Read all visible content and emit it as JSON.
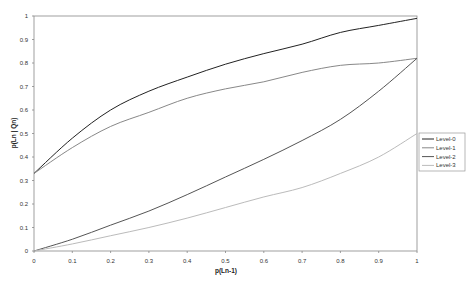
{
  "chart_data": {
    "type": "line",
    "title": "",
    "xlabel": "p(Ln-1)",
    "ylabel": "p(Ln | Qn)",
    "xlim": [
      0,
      1
    ],
    "ylim": [
      0,
      1
    ],
    "grid": false,
    "legend_position": "right",
    "x_ticks": [
      "0",
      "0.1",
      "0.2",
      "0.3",
      "0.4",
      "0.5",
      "0.6",
      "0.7",
      "0.8",
      "0.9",
      "1"
    ],
    "y_ticks": [
      "0",
      "0.1",
      "0.2",
      "0.3",
      "0.4",
      "0.5",
      "0.6",
      "0.7",
      "0.8",
      "0.9",
      "1"
    ],
    "x": [
      0,
      0.1,
      0.2,
      0.3,
      0.4,
      0.5,
      0.6,
      0.7,
      0.8,
      0.9,
      1.0
    ],
    "series": [
      {
        "name": "Level-0",
        "color": "#222222",
        "values": [
          0.33,
          0.48,
          0.6,
          0.68,
          0.74,
          0.795,
          0.84,
          0.88,
          0.93,
          0.96,
          0.99
        ]
      },
      {
        "name": "Level-1",
        "color": "#888888",
        "values": [
          0.33,
          0.44,
          0.53,
          0.59,
          0.65,
          0.69,
          0.72,
          0.76,
          0.79,
          0.8,
          0.82
        ]
      },
      {
        "name": "Level-2",
        "color": "#555555",
        "values": [
          0.0,
          0.05,
          0.11,
          0.17,
          0.24,
          0.315,
          0.39,
          0.47,
          0.56,
          0.68,
          0.82
        ]
      },
      {
        "name": "Level-3",
        "color": "#bbbbbb",
        "values": [
          0.0,
          0.03,
          0.065,
          0.1,
          0.14,
          0.185,
          0.23,
          0.27,
          0.33,
          0.4,
          0.5
        ]
      }
    ]
  }
}
